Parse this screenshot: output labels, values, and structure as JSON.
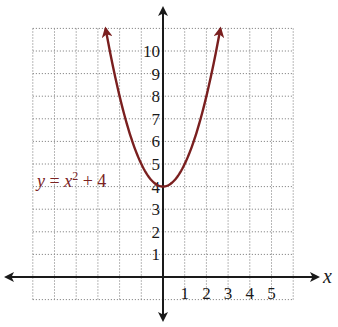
{
  "chart_data": {
    "type": "line",
    "title": "",
    "xlabel": "x",
    "ylabel": "",
    "xlim": [
      -6,
      6
    ],
    "ylim": [
      -1,
      11
    ],
    "grid": true,
    "grid_style": "dotted",
    "x_ticks": [
      1,
      2,
      3,
      4,
      5
    ],
    "y_ticks": [
      1,
      2,
      3,
      4,
      5,
      6,
      7,
      8,
      9,
      10
    ],
    "series": [
      {
        "name": "y = x^2 + 4",
        "equation": "y = x^2 + 4",
        "color": "#7a1f1f",
        "vertex": [
          0,
          4
        ],
        "arrows_both_ends": true,
        "x": [
          -2.65,
          -2,
          -1.5,
          -1,
          -0.5,
          0,
          0.5,
          1,
          1.5,
          2,
          2.65
        ],
        "y": [
          11.0,
          8,
          6.25,
          5,
          4.25,
          4,
          4.25,
          5,
          6.25,
          8,
          11.0
        ]
      }
    ],
    "annotations": [
      {
        "text": "y = x² + 4",
        "position": [
          -4.4,
          4.4
        ],
        "color": "#7a1f1f"
      }
    ],
    "legend": "none"
  },
  "labels": {
    "x_axis_name": "x",
    "equation_y": "y",
    "equation_eq": " = ",
    "equation_x": "x",
    "equation_exp": "2",
    "equation_rest": " + 4",
    "x_ticks": [
      "1",
      "2",
      "3",
      "4",
      "5"
    ],
    "y_ticks": [
      "1",
      "2",
      "3",
      "4",
      "5",
      "6",
      "7",
      "8",
      "9",
      "10"
    ]
  },
  "colors": {
    "curve": "#7a1f1f",
    "axis": "#1a1a1a",
    "grid": "#8a8a8a"
  }
}
